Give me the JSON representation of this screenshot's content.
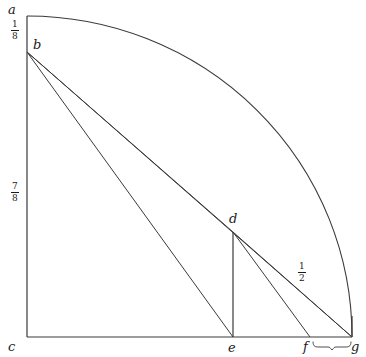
{
  "figure": {
    "background_color": "#ffffff",
    "stroke_color": "#3a3a3a",
    "text_color": "#1a1a1a",
    "width": 366,
    "height": 357
  },
  "points": [
    {
      "id": "a",
      "label": "a",
      "x": 27,
      "y": 16,
      "label_x": 8,
      "label_y": 3
    },
    {
      "id": "b",
      "label": "b",
      "x": 27,
      "y": 52,
      "label_x": 33,
      "label_y": 38
    },
    {
      "id": "c",
      "label": "c",
      "x": 27,
      "y": 337,
      "label_x": 8,
      "label_y": 340
    },
    {
      "id": "d",
      "label": "d",
      "x": 233,
      "y": 232,
      "label_x": 229,
      "label_y": 212
    },
    {
      "id": "e",
      "label": "e",
      "x": 233,
      "y": 337,
      "label_x": 228,
      "label_y": 341
    },
    {
      "id": "f",
      "label": "f",
      "x": 310,
      "y": 337,
      "label_x": 303,
      "label_y": 340
    },
    {
      "id": "g",
      "label": "g",
      "x": 352,
      "y": 337,
      "label_x": 351,
      "label_y": 340
    }
  ],
  "segments": [
    {
      "name": "left-edge-a-c",
      "from": "a",
      "to": "c"
    },
    {
      "name": "bottom-edge-c-g",
      "from": "c",
      "to": "g"
    },
    {
      "name": "right-edge-g-up",
      "from": "g",
      "to": "g_top"
    },
    {
      "name": "chord-b-e",
      "from": "b",
      "to": "e"
    },
    {
      "name": "chord-b-d",
      "from": "b",
      "to": "d"
    },
    {
      "name": "chord-b-g",
      "from": "b",
      "to": "g"
    },
    {
      "name": "vertical-d-e",
      "from": "d",
      "to": "e"
    },
    {
      "name": "chord-d-f",
      "from": "d",
      "to": "f"
    },
    {
      "name": "chord-d-g",
      "from": "d",
      "to": "g"
    }
  ],
  "arc": {
    "name": "quarter-arc-a-to-g",
    "start_x": 27,
    "start_y": 16,
    "end_x": 352,
    "end_y": 337,
    "radius": 325,
    "center_x": 27,
    "center_y": 337
  },
  "brace": {
    "name": "brace-f-to-g",
    "left_x": 313,
    "right_x": 351,
    "y": 344
  },
  "annotations": [
    {
      "id": "frac-one-eighth",
      "numerator": "1",
      "denominator": "8",
      "x": 11,
      "y": 20,
      "describes": "segment a to b"
    },
    {
      "id": "frac-seven-eighths",
      "numerator": "7",
      "denominator": "8",
      "x": 11,
      "y": 182,
      "describes": "segment b to c"
    },
    {
      "id": "frac-one-half",
      "numerator": "1",
      "denominator": "2",
      "x": 298,
      "y": 262,
      "describes": "segment d to g"
    }
  ]
}
